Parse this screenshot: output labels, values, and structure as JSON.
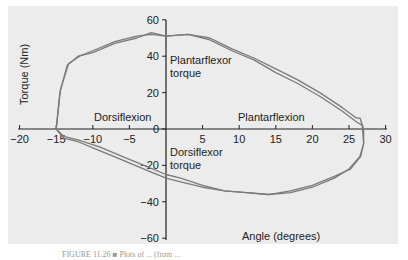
{
  "chart_data": {
    "type": "line",
    "title": "",
    "xlabel": "Angle (degrees)",
    "ylabel": "Torque (Nm)",
    "xlim": [
      -20,
      30
    ],
    "ylim": [
      -60,
      60
    ],
    "x_ticks": [
      -20,
      -15,
      -10,
      -5,
      5,
      10,
      15,
      20,
      25,
      30
    ],
    "y_ticks": [
      60,
      40,
      20,
      0,
      -20,
      -40,
      -60
    ],
    "grid": false,
    "annotations": [
      "Plantarflexor torque",
      "Dorsiflexion",
      "Plantarflexion",
      "Dorsiflexor torque"
    ],
    "series": [
      {
        "name": "trial 1 (loop)",
        "x": [
          -15,
          -14.5,
          -13.5,
          -12,
          -10,
          -7,
          -4,
          -2,
          0,
          3,
          6,
          9,
          12,
          15,
          18,
          21,
          24,
          26,
          26.5,
          27,
          27,
          26.5,
          25,
          23,
          20,
          17,
          14,
          11,
          8,
          5,
          2,
          0,
          -3,
          -6,
          -9,
          -12,
          -14,
          -15
        ],
        "y": [
          0,
          20,
          35,
          40,
          42,
          47,
          50,
          53,
          51,
          52,
          50,
          44,
          39,
          33,
          27,
          20,
          12,
          6,
          6,
          0,
          -8,
          -15,
          -22,
          -27,
          -32,
          -35,
          -36,
          -35,
          -34,
          -32,
          -29,
          -27,
          -22,
          -17,
          -12,
          -7,
          -5,
          0
        ]
      },
      {
        "name": "trial 2 (loop)",
        "x": [
          -15,
          -14.4,
          -13.3,
          -11.8,
          -10,
          -7,
          -4,
          -2,
          0,
          3,
          6,
          9,
          12,
          15,
          18,
          21,
          24,
          26,
          26.8,
          27,
          26.6,
          25.2,
          23,
          20,
          17,
          14,
          11,
          8,
          5,
          2,
          0,
          -3,
          -6,
          -9,
          -12,
          -14,
          -15
        ],
        "y": [
          0,
          22,
          36,
          40,
          43,
          48,
          51,
          52,
          51,
          52,
          49,
          43,
          38,
          31,
          25,
          18,
          10,
          4,
          2,
          -8,
          -15,
          -22,
          -26,
          -31,
          -34,
          -36,
          -35,
          -34,
          -31,
          -27,
          -25,
          -20,
          -15,
          -10,
          -6,
          -4,
          0
        ]
      }
    ]
  },
  "labels": {
    "ylabel": "Torque (Nm)",
    "xlabel": "Angle (degrees)",
    "plantarflexor_1": "Plantarflexor",
    "plantarflexor_2": "torque",
    "dorsiflexor_1": "Dorsiflexor",
    "dorsiflexor_2": "torque",
    "dorsiflexion": "Dorsiflexion",
    "plantarflexion": "Plantarflexion",
    "caption": "FIGURE 11.26 ■ Plots of ... (from ..."
  },
  "ticks": {
    "x": [
      "−20",
      "−15",
      "−10",
      "−5",
      "5",
      "10",
      "15",
      "20",
      "25",
      "30"
    ],
    "y": [
      "60",
      "40",
      "20",
      "0",
      "−20",
      "−40",
      "−60"
    ]
  },
  "colors": {
    "line": "#7a7a7a",
    "bg": "#ececec",
    "axis": "#222222"
  }
}
